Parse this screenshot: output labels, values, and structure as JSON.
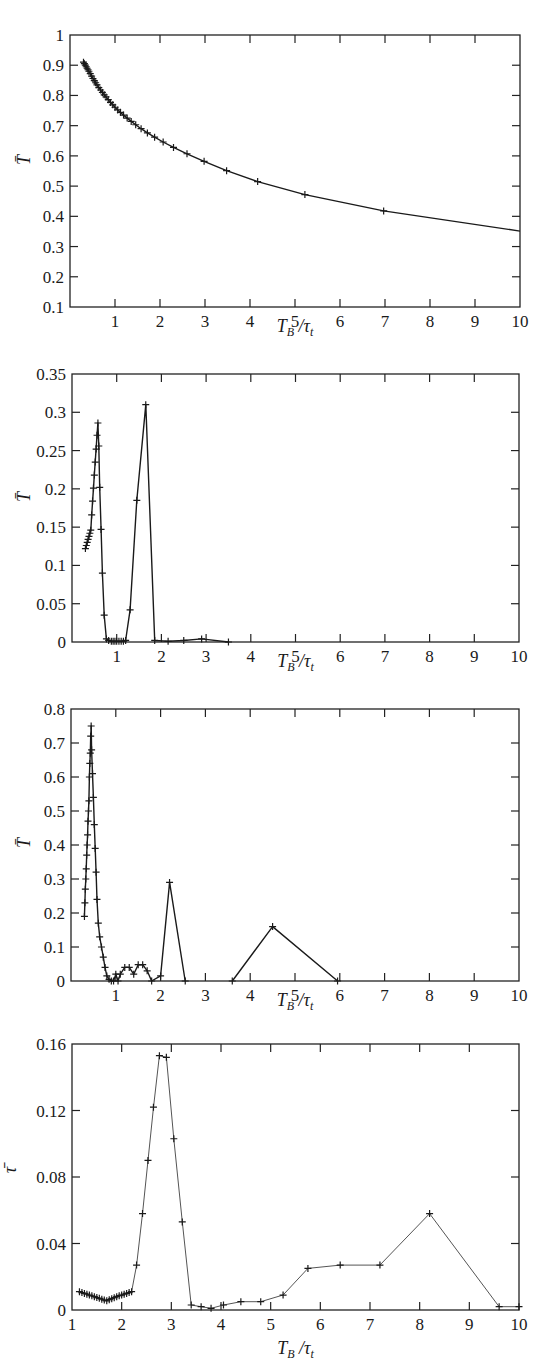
{
  "chart_data": [
    {
      "type": "line",
      "title": "",
      "xlabel": "T_B / τ_t",
      "ylabel": "T̄",
      "xlim": [
        0,
        10
      ],
      "ylim": [
        0.1,
        1
      ],
      "xticks": [
        1,
        2,
        3,
        4,
        5,
        6,
        7,
        8,
        9,
        10
      ],
      "yticks": [
        0.1,
        0.2,
        0.3,
        0.4,
        0.5,
        0.6,
        0.7,
        0.8,
        0.9,
        1
      ],
      "ytick_labels": [
        "0.1",
        "0.2",
        "0.3",
        "0.4",
        "0.5",
        "0.6",
        "0.7",
        "0.8",
        "0.9",
        "1"
      ],
      "grid": false,
      "marker": "+",
      "stroke": "#1a1a1a",
      "stroke_width": 1.4,
      "series": [
        {
          "name": "T̄",
          "x": [
            0.3,
            0.32,
            0.34,
            0.36,
            0.38,
            0.4,
            0.42,
            0.45,
            0.48,
            0.51,
            0.54,
            0.57,
            0.6,
            0.64,
            0.68,
            0.72,
            0.76,
            0.8,
            0.85,
            0.9,
            0.95,
            1.0,
            1.06,
            1.12,
            1.19,
            1.27,
            1.36,
            1.46,
            1.58,
            1.72,
            1.88,
            2.07,
            2.3,
            2.6,
            2.98,
            3.48,
            4.17,
            5.22,
            6.97,
            10
          ],
          "y": [
            0.91,
            0.905,
            0.9,
            0.895,
            0.89,
            0.885,
            0.88,
            0.872,
            0.864,
            0.856,
            0.849,
            0.842,
            0.835,
            0.826,
            0.818,
            0.81,
            0.802,
            0.795,
            0.786,
            0.777,
            0.769,
            0.761,
            0.752,
            0.744,
            0.735,
            0.725,
            0.714,
            0.703,
            0.69,
            0.676,
            0.662,
            0.646,
            0.628,
            0.607,
            0.582,
            0.551,
            0.515,
            0.472,
            0.418,
            0.351,
            0.278
          ],
          "markers_until": 39
        }
      ]
    },
    {
      "type": "line",
      "title": "",
      "xlabel": "T_B / τ_t",
      "ylabel": "T̄",
      "xlim": [
        0,
        10
      ],
      "ylim": [
        0,
        0.35
      ],
      "xticks": [
        1,
        2,
        3,
        4,
        5,
        6,
        7,
        8,
        9,
        10
      ],
      "yticks": [
        0,
        0.05,
        0.1,
        0.15,
        0.2,
        0.25,
        0.3,
        0.35
      ],
      "ytick_labels": [
        "0",
        "0.05",
        "0.1",
        "0.15",
        "0.2",
        "0.25",
        "0.3",
        "0.35"
      ],
      "grid": false,
      "marker": "+",
      "stroke": "#1a1a1a",
      "stroke_width": 1.4,
      "series": [
        {
          "name": "T̄",
          "x": [
            0.3,
            0.32,
            0.34,
            0.36,
            0.38,
            0.4,
            0.42,
            0.44,
            0.46,
            0.48,
            0.5,
            0.52,
            0.54,
            0.56,
            0.58,
            0.6,
            0.62,
            0.65,
            0.68,
            0.72,
            0.77,
            0.82,
            0.88,
            0.92,
            0.96,
            1.0,
            1.05,
            1.1,
            1.15,
            1.2,
            1.3,
            1.45,
            1.65,
            1.85,
            2.15,
            2.5,
            2.9,
            3.5
          ],
          "y": [
            0.122,
            0.126,
            0.13,
            0.134,
            0.138,
            0.142,
            0.146,
            0.166,
            0.184,
            0.201,
            0.218,
            0.235,
            0.252,
            0.27,
            0.286,
            0.256,
            0.202,
            0.147,
            0.09,
            0.035,
            0.004,
            0.002,
            0.001,
            0.001,
            0.001,
            0.001,
            0.001,
            0.001,
            0.001,
            0.002,
            0.042,
            0.185,
            0.31,
            0.002,
            0.001,
            0.002,
            0.004,
            0.0
          ],
          "extra_points": []
        }
      ]
    },
    {
      "type": "line",
      "title": "",
      "xlabel": "T_B / τ_t",
      "ylabel": "T̄",
      "xlim": [
        0,
        10
      ],
      "ylim": [
        0,
        0.8
      ],
      "xticks": [
        1,
        2,
        3,
        4,
        5,
        6,
        7,
        8,
        9,
        10
      ],
      "yticks": [
        0,
        0.1,
        0.2,
        0.3,
        0.4,
        0.5,
        0.6,
        0.7,
        0.8
      ],
      "ytick_labels": [
        "0",
        "0.1",
        "0.2",
        "0.3",
        "0.4",
        "0.5",
        "0.6",
        "0.7",
        "0.8"
      ],
      "grid": false,
      "marker": "+",
      "stroke": "#1a1a1a",
      "stroke_width": 1.4,
      "series": [
        {
          "name": "T̄",
          "x": [
            0.3,
            0.31,
            0.32,
            0.33,
            0.34,
            0.35,
            0.36,
            0.37,
            0.38,
            0.39,
            0.4,
            0.41,
            0.42,
            0.43,
            0.44,
            0.45,
            0.46,
            0.48,
            0.5,
            0.52,
            0.54,
            0.56,
            0.58,
            0.61,
            0.64,
            0.68,
            0.72,
            0.76,
            0.8,
            0.85,
            0.9,
            0.95,
            1.0,
            1.05,
            1.1,
            1.2,
            1.3,
            1.4,
            1.5,
            1.6,
            1.7,
            1.8,
            2.0,
            2.2,
            2.55
          ],
          "y": [
            0.19,
            0.23,
            0.27,
            0.3,
            0.33,
            0.37,
            0.4,
            0.43,
            0.47,
            0.5,
            0.53,
            0.6,
            0.64,
            0.67,
            0.72,
            0.75,
            0.68,
            0.61,
            0.54,
            0.46,
            0.39,
            0.32,
            0.24,
            0.17,
            0.13,
            0.1,
            0.07,
            0.04,
            0.015,
            0.005,
            0.0,
            0.0,
            0.02,
            0.0,
            0.02,
            0.04,
            0.04,
            0.02,
            0.048,
            0.048,
            0.03,
            0.0,
            0.015,
            0.29,
            0.0
          ]
        },
        {
          "name": "T̄ (second segment)",
          "x": [
            3.6,
            4.5,
            5.95
          ],
          "y": [
            0.0,
            0.16,
            0.0
          ]
        }
      ]
    },
    {
      "type": "line",
      "title": "",
      "xlabel": "T_B / τ_t",
      "ylabel": "τ̄",
      "xlim": [
        1,
        10
      ],
      "ylim": [
        0,
        0.16
      ],
      "xticks": [
        1,
        2,
        3,
        4,
        5,
        6,
        7,
        8,
        9,
        10
      ],
      "yticks": [
        0,
        0.04,
        0.08,
        0.12,
        0.16
      ],
      "ytick_labels": [
        "0",
        "0.04",
        "0.08",
        "0.12",
        "0.16"
      ],
      "grid": false,
      "marker": "+",
      "stroke": "#555555",
      "stroke_width": 1.0,
      "series": [
        {
          "name": "τ̄",
          "x": [
            1.15,
            1.2,
            1.25,
            1.3,
            1.35,
            1.4,
            1.45,
            1.5,
            1.55,
            1.6,
            1.65,
            1.7,
            1.75,
            1.8,
            1.85,
            1.9,
            1.95,
            2.0,
            2.05,
            2.1,
            2.15,
            2.2,
            2.3,
            2.42,
            2.53,
            2.64,
            2.76,
            2.9,
            3.05,
            3.22,
            3.4,
            3.6,
            3.8,
            4.05,
            4.4,
            4.8,
            5.25,
            5.75,
            6.4,
            7.2,
            8.2,
            9.6,
            10
          ],
          "y": [
            0.011,
            0.0105,
            0.01,
            0.0095,
            0.009,
            0.0085,
            0.008,
            0.0075,
            0.007,
            0.0065,
            0.006,
            0.0055,
            0.0062,
            0.0068,
            0.0074,
            0.008,
            0.0086,
            0.009,
            0.0095,
            0.01,
            0.0105,
            0.011,
            0.027,
            0.058,
            0.09,
            0.122,
            0.153,
            0.152,
            0.103,
            0.053,
            0.003,
            0.002,
            0.001,
            0.003,
            0.005,
            0.005,
            0.009,
            0.025,
            0.027,
            0.027,
            0.058,
            0.002,
            0.002
          ]
        }
      ]
    }
  ],
  "panels": [
    {
      "box": {
        "x0": 70,
        "x1": 520,
        "ytop": 35,
        "ybot": 307
      },
      "xlabel_y": 332,
      "ylabel_pos": {
        "x": 30,
        "y": 160
      }
    },
    {
      "box": {
        "x0": 72,
        "x1": 519,
        "ytop": 374,
        "ybot": 642
      },
      "xlabel_y": 667,
      "ylabel_pos": {
        "x": 30,
        "y": 497
      }
    },
    {
      "box": {
        "x0": 71,
        "x1": 519,
        "ytop": 709,
        "ybot": 981
      },
      "xlabel_y": 1006,
      "ylabel_pos": {
        "x": 30,
        "y": 843
      }
    },
    {
      "box": {
        "x0": 72,
        "x1": 519,
        "ytop": 1044,
        "ybot": 1310
      },
      "xlabel_y": 1354,
      "ylabel_pos": {
        "x": 16,
        "y": 1170
      }
    }
  ]
}
